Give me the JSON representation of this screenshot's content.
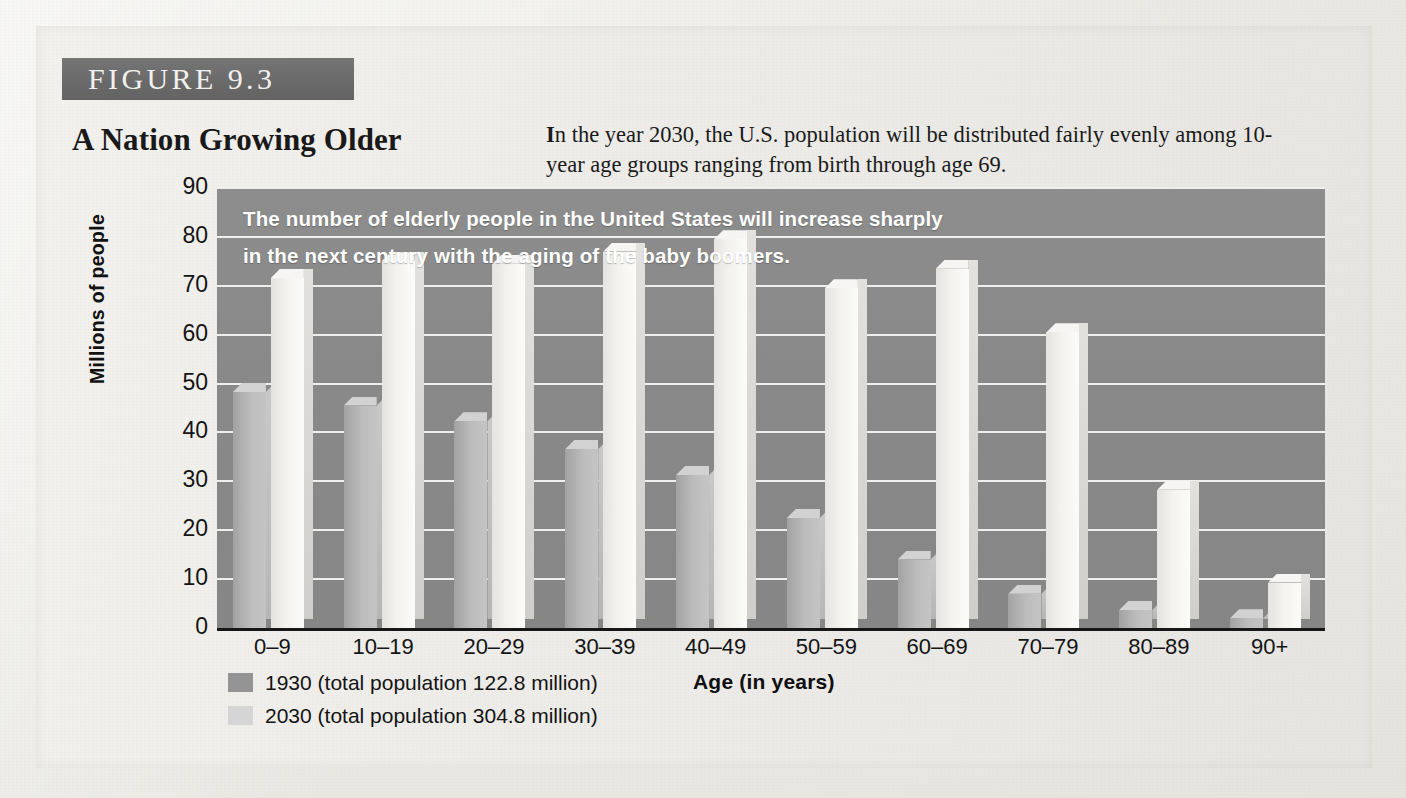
{
  "figure": {
    "badge": "FIGURE  9.3",
    "title": "A Nation Growing Older",
    "lede_first": "I",
    "lede_rest": "n the year 2030, the U.S. population will be distributed fairly evenly among 10-year age groups ranging from birth through age 69."
  },
  "colors": {
    "badge_bar": "#6b6b6b",
    "plot_background": "#8a8a8a",
    "gridline": "#efefee",
    "series_1930": "#949494",
    "series_2030": "#d5d5d5",
    "caption_text": "#ffffff",
    "axis_text": "#141414"
  },
  "chart_data": {
    "type": "bar",
    "caption_lines": [
      "The number of elderly people in the United States will increase sharply",
      "in the next century with the aging of the baby boomers."
    ],
    "xlabel": "Age (in years)",
    "ylabel": "Millions of people",
    "ylim": [
      0,
      90
    ],
    "yticks": [
      90,
      80,
      70,
      60,
      50,
      40,
      30,
      20,
      10,
      0
    ],
    "grid": true,
    "legend_position": "below-left",
    "categories": [
      "0–9",
      "10–19",
      "20–29",
      "30–39",
      "40–49",
      "50–59",
      "60–69",
      "70–79",
      "80–89",
      "90+"
    ],
    "series": [
      {
        "name": "1930 (total population 122.8 million)",
        "short_name": "1930",
        "total_population": "122.8 million",
        "color": "#b4b4b4",
        "values": [
          48.3,
          45.5,
          42.3,
          36.6,
          31.3,
          22.5,
          14.0,
          7.0,
          3.7,
          2.0
        ]
      },
      {
        "name": "2030 (total population 304.8 million)",
        "short_name": "2030",
        "total_population": "304.8 million",
        "color": "#f2f1ee",
        "values": [
          71.6,
          75.0,
          74.5,
          77.0,
          79.5,
          69.5,
          73.5,
          60.5,
          28.3,
          9.3
        ]
      }
    ]
  }
}
